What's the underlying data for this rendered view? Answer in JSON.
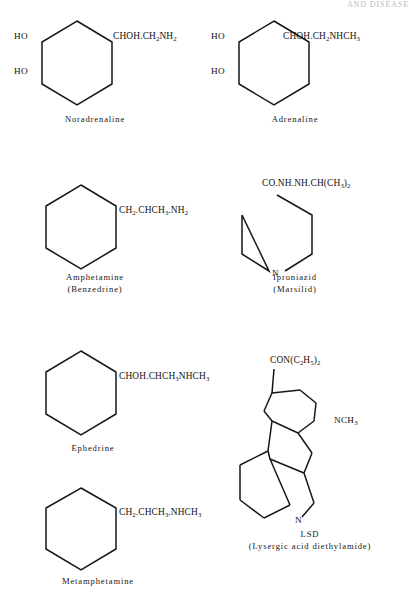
{
  "page": {
    "running_head": "AND DISEASE",
    "width": 409,
    "height": 592,
    "background": "#ffffff",
    "ink_color": "#161616"
  },
  "structures": [
    {
      "id": "noradrenaline",
      "name": "Noradrenaline",
      "caption_line1": "Noradrenaline",
      "caption_line2": "",
      "ring": "benzene-hexagon",
      "substituents": [
        {
          "label": "HO",
          "position": "upper-left"
        },
        {
          "label": "HO",
          "position": "lower-left"
        },
        {
          "label": "CHOH.CH2NH2",
          "position": "upper-right"
        }
      ],
      "formula_parts": [
        "CHOH.CH",
        "2",
        "NH",
        "2"
      ]
    },
    {
      "id": "adrenaline",
      "name": "Adrenaline",
      "caption_line1": "Adrenaline",
      "caption_line2": "",
      "ring": "benzene-hexagon",
      "substituents": [
        {
          "label": "HO",
          "position": "upper-left"
        },
        {
          "label": "HO",
          "position": "lower-left"
        },
        {
          "label": "CHOH.CH2NHCH3",
          "position": "upper-right"
        }
      ],
      "formula_parts": [
        "CHOH.CH",
        "2",
        "NHCH",
        "3"
      ]
    },
    {
      "id": "amphetamine",
      "name": "Amphetamine",
      "caption_line1": "Amphetamine",
      "caption_line2": "(Benzedrine)",
      "ring": "benzene-hexagon",
      "substituents": [
        {
          "label": "CH2.CHCH3.NH2",
          "position": "upper-right"
        }
      ],
      "formula_parts": [
        "CH",
        "2",
        ".CHCH",
        "3",
        ".NH",
        "2"
      ]
    },
    {
      "id": "iproniazid",
      "name": "Iproniazid",
      "caption_line1": "Iproniazid",
      "caption_line2": "(Marsilid)",
      "ring": "pyridine-hexagon",
      "ring_heteroatom": "N",
      "substituents": [
        {
          "label": "CO.NH.NH.CH(CH3)2",
          "position": "top"
        }
      ],
      "formula_parts": [
        "CO.NH.NH.CH(CH",
        "3",
        ")",
        "2"
      ]
    },
    {
      "id": "ephedrine",
      "name": "Ephedrine",
      "caption_line1": "Ephedrine",
      "caption_line2": "",
      "ring": "benzene-hexagon",
      "substituents": [
        {
          "label": "CHOH.CHCH3NHCH3",
          "position": "upper-right"
        }
      ],
      "formula_parts": [
        "CHOH.CHCH",
        "3",
        "NHCH",
        "3"
      ]
    },
    {
      "id": "metamphetamine",
      "name": "Metamphetamine",
      "caption_line1": "Metamphetamine",
      "caption_line2": "",
      "ring": "benzene-hexagon",
      "substituents": [
        {
          "label": "CH2.CHCH3.NHCH3",
          "position": "upper-right"
        }
      ],
      "formula_parts": [
        "CH",
        "2",
        ".CHCH",
        "3",
        ".NHCH",
        "3"
      ]
    },
    {
      "id": "lsd",
      "name": "LSD",
      "caption_line1": "LSD",
      "caption_line2": "(Lysergic acid diethylamide)",
      "ring": "ergoline-tetracyclic",
      "ring_heteroatom": "N",
      "substituents": [
        {
          "label": "CON(C2H5)2",
          "position": "top"
        },
        {
          "label": "NCH3",
          "position": "right"
        },
        {
          "label": "N",
          "position": "indole-nitrogen"
        }
      ],
      "formula_parts": [
        "CON(C",
        "2",
        "H",
        "5",
        ")",
        "2"
      ]
    }
  ],
  "labels": {
    "ho": "HO",
    "n": "N",
    "nch3_prefix": "NCH",
    "nch3_sub": "3"
  }
}
